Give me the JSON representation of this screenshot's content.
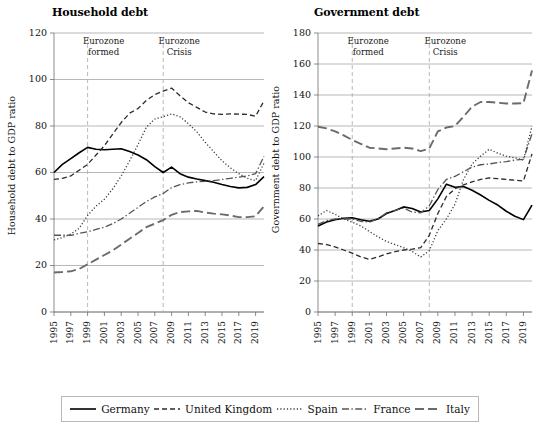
{
  "chart_data": [
    {
      "type": "line",
      "id": "household",
      "title": "Household debt",
      "xlabel": "",
      "ylabel": "Household debt to GDP ratio",
      "xlim": [
        1995,
        2020
      ],
      "ylim": [
        0,
        120
      ],
      "ytick_values": [
        0,
        20,
        40,
        60,
        80,
        100,
        120
      ],
      "ytick_labels": [
        "0",
        "20",
        "40",
        "60",
        "80",
        "100",
        "120"
      ],
      "xtick_values": [
        1995,
        1997,
        1999,
        2001,
        2003,
        2005,
        2007,
        2009,
        2011,
        2013,
        2015,
        2017,
        2019
      ],
      "xtick_labels": [
        "1995",
        "1997",
        "1999",
        "2001",
        "2003",
        "2005",
        "2007",
        "2009",
        "2011",
        "2013",
        "2015",
        "2017",
        "2019"
      ],
      "grid": true,
      "legend_position": "below-figure",
      "annotations": [
        {
          "text_line1": "Eurozone",
          "text_line2": "formed",
          "x": 1999
        },
        {
          "text_line1": "Eurozone",
          "text_line2": "Crisis",
          "x": 2008
        }
      ],
      "x": [
        1995,
        1996,
        1997,
        1998,
        1999,
        2000,
        2001,
        2002,
        2003,
        2004,
        2005,
        2006,
        2007,
        2008,
        2009,
        2010,
        2011,
        2012,
        2013,
        2014,
        2015,
        2016,
        2017,
        2018,
        2019,
        2020
      ],
      "series": [
        {
          "name": "Germany",
          "style": "solid",
          "values": [
            60.0,
            63.5,
            66.0,
            68.5,
            70.8,
            70.0,
            69.8,
            70.0,
            70.2,
            69.0,
            67.5,
            65.5,
            62.5,
            60.0,
            62.3,
            59.5,
            58.0,
            57.2,
            56.5,
            55.8,
            54.8,
            54.0,
            53.4,
            53.6,
            54.8,
            58.2
          ]
        },
        {
          "name": "United Kingdom",
          "style": "dashed",
          "values": [
            57.0,
            57.5,
            58.5,
            61.0,
            63.5,
            67.5,
            71.5,
            76.5,
            81.5,
            85.5,
            87.5,
            91.0,
            93.5,
            95.0,
            96.3,
            93.0,
            90.0,
            88.0,
            86.0,
            85.2,
            85.0,
            85.2,
            85.1,
            85.0,
            84.2,
            90.8
          ]
        },
        {
          "name": "Spain",
          "style": "dotted",
          "values": [
            31.0,
            32.0,
            33.5,
            36.0,
            41.5,
            45.5,
            48.5,
            53.0,
            58.5,
            65.0,
            72.0,
            79.5,
            83.0,
            84.0,
            85.2,
            84.0,
            81.0,
            77.5,
            73.0,
            69.0,
            65.0,
            62.0,
            59.5,
            57.5,
            56.5,
            64.0
          ]
        },
        {
          "name": "France",
          "style": "dashdot",
          "values": [
            33.0,
            33.0,
            33.0,
            33.8,
            34.5,
            35.5,
            36.5,
            38.0,
            40.0,
            42.5,
            45.0,
            47.5,
            49.5,
            51.0,
            53.5,
            54.8,
            55.5,
            56.0,
            56.2,
            56.5,
            57.0,
            57.5,
            58.0,
            58.5,
            59.5,
            67.0
          ]
        },
        {
          "name": "Italy",
          "style": "longdash",
          "values": [
            17.0,
            17.2,
            17.5,
            18.5,
            20.5,
            22.5,
            24.5,
            26.5,
            29.0,
            31.5,
            34.0,
            36.5,
            38.0,
            39.5,
            41.8,
            43.0,
            43.3,
            43.5,
            42.8,
            42.3,
            42.0,
            41.5,
            40.8,
            40.8,
            41.2,
            45.5
          ]
        }
      ]
    },
    {
      "type": "line",
      "id": "government",
      "title": "Government debt",
      "xlabel": "",
      "ylabel": "Government debt to GDP ratio",
      "xlim": [
        1995,
        2020
      ],
      "ylim": [
        0,
        180
      ],
      "ytick_values": [
        0,
        20,
        40,
        60,
        80,
        100,
        120,
        140,
        160,
        180
      ],
      "ytick_labels": [
        "0",
        "20",
        "40",
        "60",
        "80",
        "100",
        "120",
        "140",
        "160",
        "180"
      ],
      "xtick_values": [
        1995,
        1997,
        1999,
        2001,
        2003,
        2005,
        2007,
        2009,
        2011,
        2013,
        2015,
        2017,
        2019
      ],
      "xtick_labels": [
        "1995",
        "1997",
        "1999",
        "2001",
        "2003",
        "2005",
        "2007",
        "2009",
        "2011",
        "2013",
        "2015",
        "2017",
        "2019"
      ],
      "grid": true,
      "legend_position": "below-figure",
      "annotations": [
        {
          "text_line1": "Eurozone",
          "text_line2": "formed",
          "x": 1999
        },
        {
          "text_line1": "Eurozone",
          "text_line2": "Crisis",
          "x": 2008
        }
      ],
      "x": [
        1995,
        1996,
        1997,
        1998,
        1999,
        2000,
        2001,
        2002,
        2003,
        2004,
        2005,
        2006,
        2007,
        2008,
        2009,
        2010,
        2011,
        2012,
        2013,
        2014,
        2015,
        2016,
        2017,
        2018,
        2019,
        2020
      ],
      "series": [
        {
          "name": "Germany",
          "style": "solid",
          "values": [
            55.5,
            58.0,
            59.5,
            60.5,
            60.8,
            59.5,
            58.5,
            60.0,
            63.5,
            65.5,
            67.8,
            66.8,
            64.5,
            65.5,
            73.0,
            82.5,
            80.5,
            81.0,
            78.5,
            75.5,
            72.0,
            69.0,
            65.0,
            61.8,
            59.6,
            69.0
          ]
        },
        {
          "name": "United Kingdom",
          "style": "dashed",
          "values": [
            44.2,
            43.5,
            42.0,
            40.0,
            38.0,
            35.5,
            34.0,
            35.5,
            37.5,
            39.0,
            40.0,
            40.5,
            41.5,
            49.5,
            63.5,
            74.5,
            79.5,
            82.0,
            84.0,
            85.5,
            86.5,
            86.0,
            85.5,
            85.0,
            84.5,
            102.0
          ]
        },
        {
          "name": "Spain",
          "style": "dotted",
          "values": [
            62.0,
            65.5,
            63.0,
            60.0,
            58.0,
            55.5,
            52.0,
            48.5,
            45.5,
            43.5,
            41.5,
            39.0,
            35.5,
            39.5,
            52.5,
            60.0,
            69.5,
            85.5,
            95.5,
            100.5,
            105.0,
            102.5,
            100.5,
            99.5,
            98.0,
            120.0
          ]
        },
        {
          "name": "France",
          "style": "dashdot",
          "values": [
            56.5,
            59.0,
            60.0,
            60.0,
            60.0,
            58.5,
            58.0,
            60.0,
            64.0,
            65.5,
            67.0,
            64.5,
            64.0,
            68.5,
            79.0,
            85.5,
            87.5,
            90.5,
            93.5,
            95.0,
            95.5,
            96.5,
            97.0,
            98.0,
            98.5,
            115.0
          ]
        },
        {
          "name": "Italy",
          "style": "longdash",
          "values": [
            119.5,
            118.5,
            116.5,
            114.0,
            111.0,
            108.5,
            106.0,
            105.5,
            105.0,
            105.5,
            106.0,
            105.5,
            103.8,
            105.5,
            116.5,
            119.0,
            120.0,
            126.0,
            132.5,
            135.5,
            135.5,
            135.0,
            134.5,
            134.5,
            134.8,
            155.8
          ]
        }
      ]
    }
  ],
  "legend": {
    "items": [
      {
        "label": "Germany",
        "style": "solid"
      },
      {
        "label": "United Kingdom",
        "style": "dashed"
      },
      {
        "label": "Spain",
        "style": "dotted"
      },
      {
        "label": "France",
        "style": "dashdot"
      },
      {
        "label": "Italy",
        "style": "longdash"
      }
    ]
  }
}
